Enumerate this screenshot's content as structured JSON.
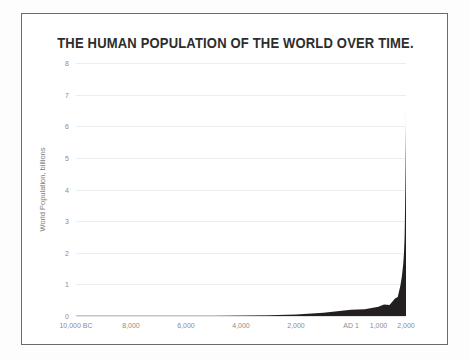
{
  "chart_data": {
    "type": "area",
    "title": "THE HUMAN POPULATION OF THE WORLD OVER TIME.",
    "xlabel": "",
    "ylabel": "World Population, billions",
    "xlim": [
      -10000,
      2000
    ],
    "ylim": [
      0,
      8
    ],
    "grid": true,
    "legend": "none",
    "fill_color": "#231f20",
    "gridline_color": "#ededed",
    "tick_label_color": "#8c8c8c",
    "title_color": "#2d2d2d",
    "y_ticks": [
      {
        "value": 0,
        "label": "0"
      },
      {
        "value": 1,
        "label": "1"
      },
      {
        "value": 2,
        "label": "2"
      },
      {
        "value": 3,
        "label": "3"
      },
      {
        "value": 4,
        "label": "4"
      },
      {
        "value": 5,
        "label": "5"
      },
      {
        "value": 6,
        "label": "6"
      },
      {
        "value": 7,
        "label": "7"
      },
      {
        "value": 8,
        "label": "8"
      }
    ],
    "x_ticks": [
      {
        "value": -10000,
        "label": "10,000 BC"
      },
      {
        "value": -8000,
        "label": "8,000"
      },
      {
        "value": -6000,
        "label": "6,000"
      },
      {
        "value": -4000,
        "label": "4,000"
      },
      {
        "value": -2000,
        "label": "2,000"
      },
      {
        "value": 1,
        "label": "AD 1"
      },
      {
        "value": 1000,
        "label": "1,000"
      },
      {
        "value": 2000,
        "label": "2,000"
      }
    ],
    "x": [
      -10000,
      -8000,
      -6000,
      -5000,
      -4000,
      -3000,
      -2000,
      -1000,
      -500,
      1,
      500,
      1000,
      1200,
      1400,
      1500,
      1600,
      1700,
      1750,
      1800,
      1850,
      1900,
      1927,
      1950,
      1960,
      1975,
      1987,
      1999,
      2000
    ],
    "values": [
      0.004,
      0.005,
      0.007,
      0.01,
      0.015,
      0.025,
      0.05,
      0.1,
      0.15,
      0.2,
      0.21,
      0.29,
      0.36,
      0.35,
      0.45,
      0.55,
      0.6,
      0.79,
      0.98,
      1.26,
      1.65,
      2.0,
      2.52,
      3.02,
      4.0,
      5.0,
      6.0,
      6.9
    ],
    "series_name": "World population"
  }
}
